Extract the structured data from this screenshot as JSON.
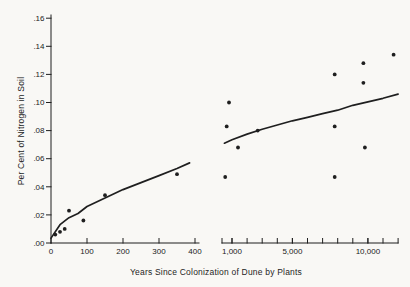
{
  "figure": {
    "background": "#f9f8f5",
    "ink": "#1f1f1f"
  },
  "chart_data": {
    "type": "scatter",
    "title": "",
    "xlabel": "Years Since Colonization of Dune by Plants",
    "ylabel": "Per Cent of Nitrogen in Soil",
    "grid": false,
    "legend": false,
    "y_axis": {
      "range": [
        0,
        0.16
      ],
      "ticks": [
        {
          "value": 0.0,
          "label": ".00"
        },
        {
          "value": 0.02,
          "label": ".02"
        },
        {
          "value": 0.04,
          "label": ".04"
        },
        {
          "value": 0.06,
          "label": ".06"
        },
        {
          "value": 0.08,
          "label": ".08"
        },
        {
          "value": 0.1,
          "label": ".10"
        },
        {
          "value": 0.12,
          "label": ".12"
        },
        {
          "value": 0.14,
          "label": ".14"
        },
        {
          "value": 0.16,
          "label": ".16"
        }
      ]
    },
    "x_axis_break": true,
    "panels": [
      {
        "name": "recent-years-linear",
        "scale": "linear",
        "x_range": [
          0,
          410
        ],
        "ticks": [
          {
            "value": 0,
            "label": "0"
          },
          {
            "value": 100,
            "label": "100"
          },
          {
            "value": 200,
            "label": "200"
          },
          {
            "value": 300,
            "label": "300"
          },
          {
            "value": 400,
            "label": "400"
          }
        ],
        "minor_ticks": [],
        "points": [
          [
            12,
            0.006
          ],
          [
            25,
            0.008
          ],
          [
            38,
            0.01
          ],
          [
            50,
            0.023
          ],
          [
            90,
            0.016
          ],
          [
            150,
            0.034
          ],
          [
            350,
            0.049
          ]
        ],
        "curve": [
          [
            0,
            0.0035
          ],
          [
            25,
            0.013
          ],
          [
            50,
            0.018
          ],
          [
            75,
            0.021
          ],
          [
            100,
            0.026
          ],
          [
            150,
            0.032
          ],
          [
            200,
            0.038
          ],
          [
            250,
            0.043
          ],
          [
            300,
            0.048
          ],
          [
            350,
            0.053
          ],
          [
            385,
            0.057
          ]
        ]
      },
      {
        "name": "ancient-years-compressed",
        "scale": "linear",
        "x_range": [
          350,
          12000
        ],
        "ticks": [
          {
            "value": 1000,
            "label": "1,000"
          },
          {
            "value": 5000,
            "label": "5,000"
          },
          {
            "value": 10000,
            "label": "10,000"
          }
        ],
        "minor_ticks": [
          1000,
          2000,
          3000,
          4000,
          5000,
          6000,
          7000,
          8000,
          9000,
          10000,
          11000,
          12000
        ],
        "points": [
          [
            550,
            0.047
          ],
          [
            650,
            0.083
          ],
          [
            800,
            0.1
          ],
          [
            1400,
            0.068
          ],
          [
            2700,
            0.08
          ],
          [
            7800,
            0.12
          ],
          [
            7800,
            0.083
          ],
          [
            7800,
            0.047
          ],
          [
            9700,
            0.128
          ],
          [
            9700,
            0.114
          ],
          [
            9800,
            0.068
          ],
          [
            11700,
            0.134
          ]
        ],
        "curve": [
          [
            500,
            0.071
          ],
          [
            1000,
            0.0735
          ],
          [
            2000,
            0.0775
          ],
          [
            3000,
            0.081
          ],
          [
            4000,
            0.084
          ],
          [
            5000,
            0.087
          ],
          [
            6000,
            0.0895
          ],
          [
            7000,
            0.092
          ],
          [
            8000,
            0.0945
          ],
          [
            9000,
            0.098
          ],
          [
            10000,
            0.1005
          ],
          [
            11000,
            0.103
          ],
          [
            12000,
            0.106
          ]
        ]
      }
    ]
  }
}
